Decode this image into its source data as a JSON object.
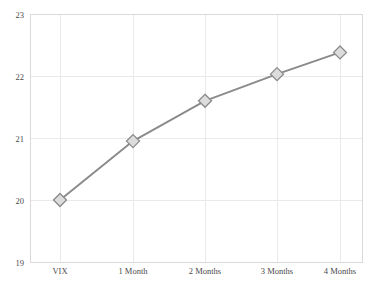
{
  "chart_data": {
    "type": "line",
    "title": "",
    "subtitle": "",
    "xlabel": "",
    "ylabel": "",
    "categories": [
      "VIX",
      "1 Month",
      "2 Months",
      "3 Months",
      "4 Months"
    ],
    "values": [
      20.0,
      20.95,
      21.6,
      22.03,
      22.38
    ],
    "series": [
      {
        "name": "VIX term structure",
        "values": [
          20.0,
          20.95,
          21.6,
          22.03,
          22.38
        ]
      }
    ],
    "ylim": [
      19,
      23
    ],
    "yticks": [
      19,
      20,
      21,
      22,
      23
    ],
    "ytick_labels": [
      "19",
      "20",
      "21",
      "22",
      "23"
    ],
    "xtick_labels": [
      "VIX",
      "1 Month",
      "2 Months",
      "3 Months",
      "4 Months"
    ],
    "grid": true,
    "grid_axis": "both",
    "legend": false,
    "legend_position": "none",
    "marker": "diamond",
    "annotations": []
  },
  "style": {
    "background_color": "#ffffff",
    "plot_background_color": "#ffffff",
    "line_color": "#8a8a8a",
    "marker_fill_color": "#dcdcdc",
    "marker_edge_color": "#8a8a8a",
    "grid_color": "#e9e9e9",
    "frame_color": "#d9d9d9",
    "tick_label_color": "#4a4a4a"
  },
  "geometry": {
    "plot_left": 30,
    "plot_right": 362,
    "plot_top": 14,
    "plot_bottom": 262,
    "x_positions": [
      60,
      133,
      205,
      277,
      340
    ],
    "y_gridlines": [
      262,
      203,
      139,
      74,
      14
    ],
    "point_pixels": [
      {
        "x": 60,
        "y": 203
      },
      {
        "x": 133,
        "y": 142
      },
      {
        "x": 205,
        "y": 101
      },
      {
        "x": 277,
        "y": 75
      },
      {
        "x": 340,
        "y": 52
      }
    ],
    "marker_half_size": 6.5,
    "xtick_label_y": 274,
    "ytick_label_x": 24
  }
}
